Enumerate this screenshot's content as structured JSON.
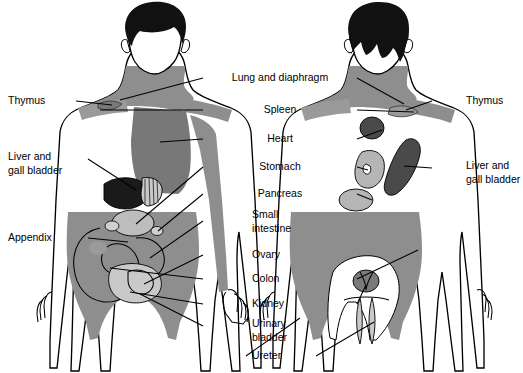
{
  "figure": {
    "views": [
      {
        "name": "front-view",
        "position": "left"
      },
      {
        "name": "back-view",
        "position": "right"
      }
    ]
  },
  "colors": {
    "background": "#ffffff",
    "outline": "#000000",
    "hair": "#111111",
    "skin": "#ffffff",
    "pain_light": "#c9c9c9",
    "pain_mid": "#9a9a9a",
    "pain_gray": "#8e8e8e",
    "pain_dark": "#6f6f6f",
    "pain_darker": "#4a4a4a",
    "organ_black": "#1a1a1a",
    "leader_line": "#000000"
  },
  "labels": {
    "left": [
      {
        "id": "thymus",
        "text": "Thymus",
        "x": 42,
        "y": 101
      },
      {
        "id": "liver-gall-bladder",
        "line1": "Liver and",
        "line2": "gall bladder",
        "x": 44,
        "y": 163
      },
      {
        "id": "appendix",
        "text": "Appendix",
        "x": 44,
        "y": 238
      }
    ],
    "center": [
      {
        "id": "lung-and-diaphragm",
        "text": "Lung and diaphragm",
        "x": 280,
        "y": 78
      },
      {
        "id": "spleen",
        "text": "Spleen",
        "x": 280,
        "y": 110
      },
      {
        "id": "heart",
        "text": "Heart",
        "x": 280,
        "y": 139
      },
      {
        "id": "stomach",
        "text": "Stomach",
        "x": 280,
        "y": 167
      },
      {
        "id": "pancreas",
        "text": "Pancreas",
        "x": 280,
        "y": 194
      },
      {
        "id": "small-intestine",
        "line1": "Small",
        "line2": "intestine",
        "x": 280,
        "y": 221
      },
      {
        "id": "ovary",
        "text": "Ovary",
        "x": 280,
        "y": 255
      },
      {
        "id": "colon",
        "text": "Colon",
        "x": 280,
        "y": 279
      },
      {
        "id": "kidney",
        "text": "Kidney",
        "x": 280,
        "y": 304
      },
      {
        "id": "urinary-bladder",
        "line1": "Urinary",
        "line2": "bladder",
        "x": 280,
        "y": 330
      },
      {
        "id": "ureter",
        "text": "Ureter",
        "x": 280,
        "y": 359
      }
    ],
    "right": [
      {
        "id": "thymus-right",
        "text": "Thymus",
        "x": 466,
        "y": 101
      },
      {
        "id": "liver-gall-bladder-right",
        "line1": "Liver and",
        "line2": "gall bladder",
        "x": 466,
        "y": 172
      }
    ]
  },
  "organs": {
    "front": [
      "thymus",
      "lung-and-diaphragm",
      "spleen",
      "heart",
      "stomach",
      "liver-and-gall-bladder",
      "pancreas",
      "small-intestine",
      "appendix",
      "colon",
      "ovary",
      "urinary-bladder"
    ],
    "back": [
      "thymus",
      "lung-and-diaphragm",
      "spleen",
      "heart",
      "stomach",
      "liver-and-gall-bladder",
      "pancreas",
      "kidney",
      "ureter",
      "colon"
    ]
  }
}
